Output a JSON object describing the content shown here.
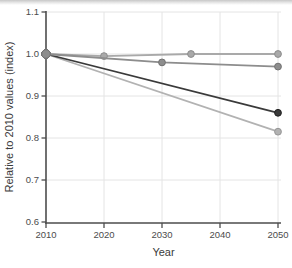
{
  "page": {
    "background": "#ffffff"
  },
  "chart_data": {
    "type": "line",
    "title": "",
    "xlabel": "Year",
    "ylabel": "Relative to 2010 values (index)",
    "xlim": [
      2010,
      2050
    ],
    "ylim": [
      0.6,
      1.1
    ],
    "xticks": [
      2010,
      2020,
      2030,
      2040,
      2050
    ],
    "xtick_labels": [
      "2010",
      "2020",
      "2030",
      "2040",
      "2050"
    ],
    "yticks": [
      0.6,
      0.7,
      0.8,
      0.9,
      1.0,
      1.1
    ],
    "ytick_labels": [
      "0.6",
      "0.7",
      "0.8",
      "0.9",
      "1.0",
      "1.1"
    ],
    "grid": true,
    "legend": "none",
    "series": [
      {
        "name": "series-1-flat-light-gray",
        "color": "#a9a9a9",
        "points": [
          [
            2010,
            1.0
          ],
          [
            2020,
            0.995
          ],
          [
            2035,
            1.0
          ],
          [
            2050,
            1.0
          ]
        ]
      },
      {
        "name": "series-2-gray-slight-decline",
        "color": "#8d8d8d",
        "points": [
          [
            2010,
            1.0
          ],
          [
            2030,
            0.98
          ],
          [
            2050,
            0.97
          ]
        ]
      },
      {
        "name": "series-3-dark-gray-decline",
        "color": "#3a3a3a",
        "points": [
          [
            2010,
            1.0
          ],
          [
            2050,
            0.86
          ]
        ]
      },
      {
        "name": "series-4-light-gray-steep-decline",
        "color": "#b2b2b2",
        "points": [
          [
            2010,
            1.0
          ],
          [
            2050,
            0.815
          ]
        ]
      }
    ],
    "style": {
      "grid_color": "#e4e4e4",
      "axis_color": "#4d4d4d",
      "tick_label_color": "#4c4c4c",
      "axis_title_color": "#3a3a3a",
      "background": "#ffffff"
    }
  }
}
